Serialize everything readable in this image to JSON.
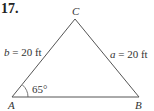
{
  "problem": {
    "number": "17."
  },
  "triangle": {
    "vertices": {
      "A": {
        "label": "A",
        "x": 12,
        "y": 97
      },
      "B": {
        "label": "B",
        "x": 139,
        "y": 97
      },
      "C": {
        "label": "C",
        "x": 75,
        "y": 19
      }
    },
    "sides": {
      "b": {
        "var": "b",
        "text": "= 20 ft"
      },
      "a": {
        "var": "a",
        "text": "= 20 ft"
      }
    },
    "angle_A": {
      "text": "65°"
    }
  },
  "colors": {
    "line": "#555555",
    "text": "#333333"
  }
}
